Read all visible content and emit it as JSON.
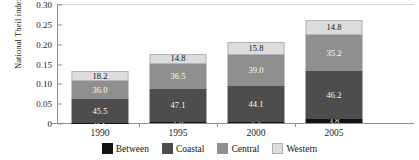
{
  "chart_data": {
    "type": "bar",
    "subtype": "stacked-bar",
    "title": "",
    "xlabel": "",
    "ylabel": "National Theil index",
    "categories": [
      "1990",
      "1995",
      "2000",
      "2005"
    ],
    "ylim": [
      0,
      0.3
    ],
    "yticks": [
      "0",
      "0.05",
      "0.10",
      "0.15",
      "0.20",
      "0.25",
      "0.30"
    ],
    "ytick_values": [
      0,
      0.05,
      0.1,
      0.15,
      0.2,
      0.25,
      0.3
    ],
    "grid": false,
    "legend_position": "bottom",
    "data_label_units": "percent of total",
    "totals": [
      0.13,
      0.175,
      0.205,
      0.26
    ],
    "series": [
      {
        "name": "Between",
        "color": "#111111",
        "values": [
          0.3,
          1.6,
          1.1,
          3.8
        ]
      },
      {
        "name": "Coastal",
        "color": "#4d4d4d",
        "values": [
          45.5,
          47.1,
          44.1,
          46.2
        ]
      },
      {
        "name": "Central",
        "color": "#8f8f8f",
        "values": [
          36.0,
          39.0,
          39.0,
          35.2
        ]
      },
      {
        "name": "Western",
        "color": "#dcdcdc",
        "values": [
          18.2,
          14.8,
          15.8,
          14.8
        ]
      }
    ],
    "bars": [
      {
        "category": "1990",
        "total": 0.13,
        "segments": [
          {
            "name": "Western",
            "label": "18.2",
            "value": 18.2,
            "color": "#dcdcdc"
          },
          {
            "name": "Central",
            "label": "36.0",
            "value": 36.0,
            "color": "#8f8f8f"
          },
          {
            "name": "Coastal",
            "label": "45.5",
            "value": 45.5,
            "color": "#4d4d4d"
          },
          {
            "name": "Between",
            "label": "0.3",
            "value": 0.3,
            "color": "#111111"
          }
        ]
      },
      {
        "category": "1995",
        "total": 0.175,
        "segments": [
          {
            "name": "Western",
            "label": "14.8",
            "value": 14.8,
            "color": "#dcdcdc"
          },
          {
            "name": "Central",
            "label": "36.5",
            "value": 36.5,
            "color": "#8f8f8f"
          },
          {
            "name": "Coastal",
            "label": "47.1",
            "value": 47.1,
            "color": "#4d4d4d"
          },
          {
            "name": "Between",
            "label": "1.6",
            "value": 1.6,
            "color": "#111111"
          }
        ]
      },
      {
        "category": "2000",
        "total": 0.205,
        "segments": [
          {
            "name": "Western",
            "label": "15.8",
            "value": 15.8,
            "color": "#dcdcdc"
          },
          {
            "name": "Central",
            "label": "39.0",
            "value": 39.0,
            "color": "#8f8f8f"
          },
          {
            "name": "Coastal",
            "label": "44.1",
            "value": 44.1,
            "color": "#4d4d4d"
          },
          {
            "name": "Between",
            "label": "1.1",
            "value": 1.1,
            "color": "#111111"
          }
        ]
      },
      {
        "category": "2005",
        "total": 0.26,
        "segments": [
          {
            "name": "Western",
            "label": "14.8",
            "value": 14.8,
            "color": "#dcdcdc"
          },
          {
            "name": "Central",
            "label": "35.2",
            "value": 35.2,
            "color": "#8f8f8f"
          },
          {
            "name": "Coastal",
            "label": "46.2",
            "value": 46.2,
            "color": "#4d4d4d"
          },
          {
            "name": "Between",
            "label": "3.8",
            "value": 3.8,
            "color": "#111111"
          }
        ]
      }
    ],
    "legend": [
      {
        "label": "Between",
        "color": "#111111"
      },
      {
        "label": "Coastal",
        "color": "#4d4d4d"
      },
      {
        "label": "Central",
        "color": "#8f8f8f"
      },
      {
        "label": "Western",
        "color": "#dcdcdc"
      }
    ]
  }
}
